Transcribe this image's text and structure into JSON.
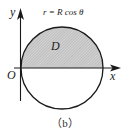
{
  "figure": {
    "equation": "r = R cos θ",
    "region_label": "D",
    "origin_label": "O",
    "x_axis_label": "x",
    "y_axis_label": "y",
    "caption": "（b）"
  },
  "colors": {
    "stroke": "#1a1a1a",
    "hatch_fill": "#c8c8c8",
    "background": "#ffffff"
  }
}
